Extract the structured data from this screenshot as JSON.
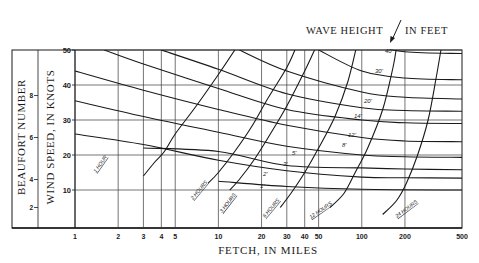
{
  "chart_data": {
    "type": "line",
    "title": "",
    "annotation_title": "WAVE HEIGHT / IN FEET",
    "xlabel": "FETCH, IN MILES",
    "ylabel": "WIND SPEED, IN KNOTS",
    "ylabel_secondary": "BEAUFORT NUMBER",
    "x_scale": "log",
    "xlim": [
      1,
      500
    ],
    "ylim": [
      0,
      50
    ],
    "x_ticks": [
      "1",
      "2",
      "3",
      "4",
      "5",
      "10",
      "20",
      "30",
      "40",
      "50",
      "100",
      "200",
      "500"
    ],
    "x_tick_values": [
      1,
      2,
      3,
      4,
      5,
      10,
      20,
      30,
      40,
      50,
      100,
      200,
      500
    ],
    "y_ticks": [
      "10",
      "20",
      "30",
      "40",
      "50"
    ],
    "y_tick_values": [
      10,
      20,
      30,
      40,
      50
    ],
    "beaufort_ticks": [
      "2",
      "4",
      "6",
      "8"
    ],
    "beaufort_tick_wind_knots": [
      5,
      13,
      25,
      37
    ],
    "grid": true,
    "wave_height_series": [
      {
        "name": "1'",
        "label": "1'",
        "points": [
          [
            5,
            21
          ],
          [
            10,
            16
          ],
          [
            20,
            13
          ],
          [
            50,
            11.5
          ],
          [
            100,
            11
          ],
          [
            200,
            10.5
          ],
          [
            500,
            10.3
          ]
        ]
      },
      {
        "name": "2'",
        "label": "2'",
        "points": [
          [
            10,
            21
          ],
          [
            20,
            17.5
          ],
          [
            50,
            15.5
          ],
          [
            100,
            14.8
          ],
          [
            200,
            14.5
          ],
          [
            500,
            14.3
          ]
        ]
      },
      {
        "name": "3'",
        "label": "3'",
        "points": [
          [
            10,
            26
          ],
          [
            20,
            21.5
          ],
          [
            50,
            19
          ],
          [
            100,
            18
          ],
          [
            200,
            17.7
          ],
          [
            500,
            17.5
          ]
        ]
      },
      {
        "name": "5'",
        "label": "5'",
        "points": [
          [
            10,
            32
          ],
          [
            20,
            26
          ],
          [
            50,
            22.5
          ],
          [
            100,
            21.5
          ],
          [
            200,
            21
          ],
          [
            500,
            20.8
          ]
        ]
      },
      {
        "name": "8'",
        "label": "8'",
        "points": [
          [
            1,
            26
          ],
          [
            2,
            24.5
          ],
          [
            5,
            21
          ],
          [
            10,
            19
          ],
          [
            20,
            17
          ],
          [
            50,
            25
          ],
          [
            100,
            24.5
          ],
          [
            500,
            24
          ]
        ]
      },
      {
        "name": "12'",
        "label": "12'",
        "points": [
          [
            1,
            35
          ],
          [
            3,
            31
          ],
          [
            10,
            26
          ],
          [
            20,
            23
          ],
          [
            50,
            28.5
          ],
          [
            100,
            27.5
          ],
          [
            500,
            27
          ]
        ]
      },
      {
        "name": "14'",
        "label": "14'",
        "points": [
          [
            1,
            44
          ],
          [
            3,
            39
          ],
          [
            10,
            33
          ],
          [
            30,
            28
          ],
          [
            100,
            31
          ],
          [
            500,
            30.5
          ]
        ]
      },
      {
        "name": "20'",
        "label": "20'",
        "points": [
          [
            3,
            50
          ],
          [
            10,
            42
          ],
          [
            30,
            35
          ],
          [
            100,
            34
          ],
          [
            500,
            33.5
          ]
        ]
      },
      {
        "name": "30'",
        "label": "30'",
        "points": [
          [
            20,
            50
          ],
          [
            50,
            44
          ],
          [
            100,
            42
          ],
          [
            200,
            41
          ],
          [
            500,
            40.5
          ]
        ]
      },
      {
        "name": "40'",
        "label": "40'",
        "points": [
          [
            60,
            50
          ],
          [
            100,
            49
          ],
          [
            200,
            48
          ],
          [
            500,
            47.5
          ]
        ]
      }
    ],
    "duration_series": [
      {
        "name": "1 HOUR",
        "label": "1 HOUR",
        "points": [
          [
            3.2,
            14
          ],
          [
            4,
            19
          ],
          [
            5,
            25
          ],
          [
            7,
            33
          ],
          [
            10,
            42
          ],
          [
            13,
            50
          ]
        ]
      },
      {
        "name": "2 HOURS",
        "label": "2 HOURS",
        "points": [
          [
            9,
            10
          ],
          [
            12,
            15
          ],
          [
            16,
            22
          ],
          [
            22,
            30
          ],
          [
            30,
            40
          ],
          [
            40,
            50
          ]
        ]
      },
      {
        "name": "3 HOURS",
        "label": "3 HOURS",
        "points": [
          [
            12,
            8
          ],
          [
            16,
            12
          ],
          [
            22,
            18
          ],
          [
            30,
            26
          ],
          [
            40,
            36
          ],
          [
            55,
            50
          ]
        ]
      },
      {
        "name": "6 HOURS",
        "label": "6 HOURS",
        "points": [
          [
            22,
            6
          ],
          [
            30,
            10
          ],
          [
            40,
            15
          ],
          [
            55,
            22
          ],
          [
            75,
            32
          ],
          [
            100,
            50
          ]
        ]
      },
      {
        "name": "12 HOURS",
        "label": "12 HOURS",
        "points": [
          [
            45,
            5
          ],
          [
            60,
            9
          ],
          [
            80,
            14
          ],
          [
            110,
            22
          ],
          [
            140,
            32
          ],
          [
            170,
            50
          ]
        ]
      },
      {
        "name": "24 HOURS",
        "label": "24 HOURS",
        "points": [
          [
            100,
            4
          ],
          [
            150,
            8
          ],
          [
            200,
            14
          ],
          [
            260,
            24
          ],
          [
            320,
            36
          ],
          [
            380,
            50
          ]
        ]
      }
    ]
  },
  "labels": {
    "wave_height_title_left": "WAVE HEIGHT",
    "wave_height_title_right": "IN FEET",
    "xlabel": "FETCH, IN MILES",
    "ylabel": "WIND SPEED, IN KNOTS",
    "ylabel_secondary": "BEAUFORT NUMBER"
  },
  "colors": {
    "ink": "#1a1a1a",
    "grid": "#3a3a3a",
    "background": "#ffffff"
  }
}
